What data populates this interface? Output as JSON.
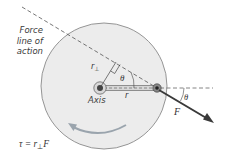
{
  "diagram": {
    "caption": {
      "line1": "Force",
      "line2": "line of",
      "line3": "action"
    },
    "labels": {
      "axis": "Axis",
      "r": "r",
      "r_perp_base": "r",
      "r_perp_sub": "⊥",
      "theta_inner": "θ",
      "theta_outer": "θ",
      "force": "F"
    },
    "formula": {
      "lhs": "τ = r",
      "sub": "⊥",
      "rhs": "F"
    },
    "colors": {
      "disk_fill": "#ececec",
      "disk_stroke": "#8a8a8a",
      "rotation_arrow": "#9aa4ad",
      "force_arrow": "#3a3a3a",
      "dashed_line": "#555555",
      "rod": "#cfcfcf"
    }
  }
}
